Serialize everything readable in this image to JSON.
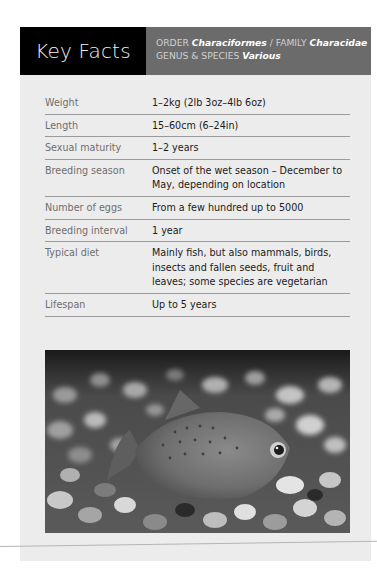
{
  "header": {
    "title": "Key Facts",
    "taxonomy": {
      "order_label": "ORDER",
      "order_value": "Characiformes",
      "separator": "/",
      "family_label": "FAMILY",
      "family_value": "Characidae",
      "genus_label": "GENUS & SPECIES",
      "genus_value": "Various"
    }
  },
  "facts": [
    {
      "label": "Weight",
      "value": "1–2kg (2lb 3oz–4lb 6oz)"
    },
    {
      "label": "Length",
      "value": "15–60cm (6–24in)"
    },
    {
      "label": "Sexual maturity",
      "value": "1–2 years"
    },
    {
      "label": "Breeding season",
      "value": "Onset of the wet season – December to May, depending on location"
    },
    {
      "label": "Number of eggs",
      "value": "From a few hundred up to 5000"
    },
    {
      "label": "Breeding interval",
      "value": "1 year"
    },
    {
      "label": "Typical diet",
      "value": "Mainly fish, but also mammals, birds, insects and fallen seeds, fruit and leaves; some species are vegetarian"
    },
    {
      "label": "Lifespan",
      "value": "Up to 5 years"
    }
  ],
  "photo": {
    "subject": "piranha-fish-on-gravel",
    "style": "grayscale"
  }
}
